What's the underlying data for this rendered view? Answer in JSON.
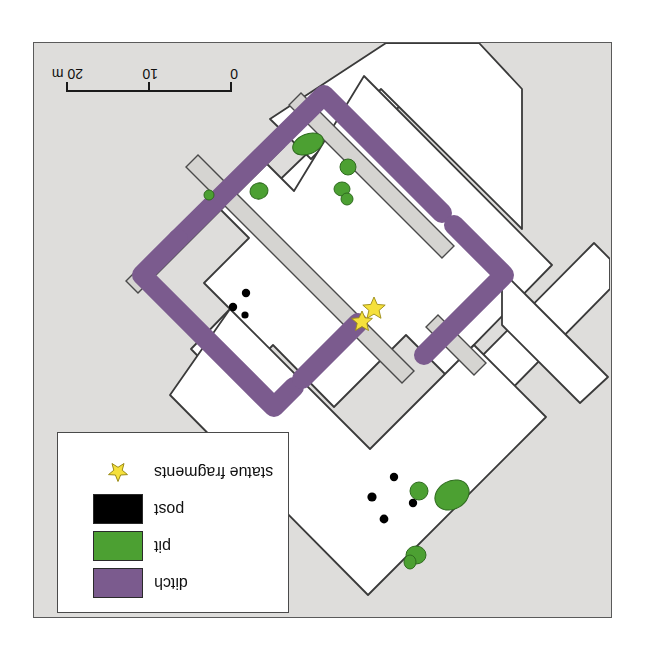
{
  "figure": {
    "type": "archaeological-excavation-plan",
    "orientation_note": "legend and scale bar are printed upside-down (rotated 180 degrees)"
  },
  "scale_bar": {
    "name": "scale-bar",
    "unit": "m",
    "ticks": [
      {
        "label": "0",
        "value": 0
      },
      {
        "label": "10",
        "value": 10
      },
      {
        "label": "20 m",
        "value": 20
      }
    ]
  },
  "legend": {
    "name": "map-legend",
    "rows": [
      {
        "label": "ditch",
        "symbol": "swatch",
        "color": "#7B5B8E"
      },
      {
        "label": "pit",
        "symbol": "swatch",
        "color": "#4CA032"
      },
      {
        "label": "post",
        "symbol": "swatch",
        "color": "#000000"
      },
      {
        "label": "statue fragments",
        "symbol": "star",
        "color": "#F5E03C"
      }
    ]
  },
  "colors": {
    "background_outside": "#ffffff",
    "unexcavated_ground": "#dedddb",
    "trench_fill": "#ffffff",
    "baulk": "#d5d4d1",
    "ditch": "#7B5B8E",
    "pit": "#4CA032",
    "post": "#000000",
    "statue_star": "#F5E03C",
    "outline": "#3a3a3a",
    "frame": "#5a5a5a"
  },
  "map_features": {
    "ditch_enclosure": {
      "name": "rectangular-ditched-enclosure",
      "color": "#7B5B8E",
      "description": "square enclosure ditch set diagonally, with a gap (entrance) on the south-east side"
    },
    "baulks": {
      "name": "unexcavated-baulks",
      "color": "#d5d4d1",
      "count": 3
    },
    "pits": {
      "name": "pits",
      "color": "#4CA032",
      "count": 10
    },
    "posts": {
      "name": "post-holes",
      "color": "#000000",
      "count": 7
    },
    "statue_fragments": {
      "name": "statue-fragments-findspot",
      "color": "#F5E03C",
      "count": 1
    }
  }
}
